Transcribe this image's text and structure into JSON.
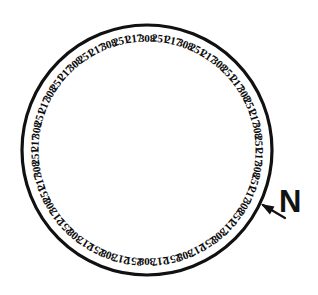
{
  "figure": {
    "type": "circular-ring-label-diagram",
    "background_color": "#ffffff",
    "ink_color": "#111111"
  },
  "ring": {
    "center_x": 147,
    "center_y": 150,
    "radius": 125,
    "stroke_width": 3.2,
    "label_radius": 111,
    "label_count": 54,
    "start_angle_deg": -90,
    "direction": "clockwise",
    "repeating_sequence": [
      308,
      251,
      217
    ],
    "labels": [
      "308",
      "251",
      "217",
      "308",
      "251",
      "217",
      "308",
      "251",
      "217",
      "308",
      "251",
      "217",
      "308",
      "251",
      "217",
      "308",
      "251",
      "217",
      "308",
      "251",
      "217",
      "308",
      "251",
      "217",
      "308",
      "251",
      "217",
      "308",
      "251",
      "217",
      "308",
      "251",
      "217",
      "308",
      "251",
      "217",
      "308",
      "251",
      "217",
      "308",
      "251",
      "217",
      "308",
      "251",
      "217",
      "308",
      "251",
      "217",
      "308",
      "251",
      "217",
      "308",
      "251",
      "217"
    ]
  },
  "north_marker": {
    "label": "N",
    "arrow_tip_x": 261,
    "arrow_tip_y": 204,
    "arrow_tail_x": 285,
    "arrow_tail_y": 218,
    "angle_deg": 25
  }
}
